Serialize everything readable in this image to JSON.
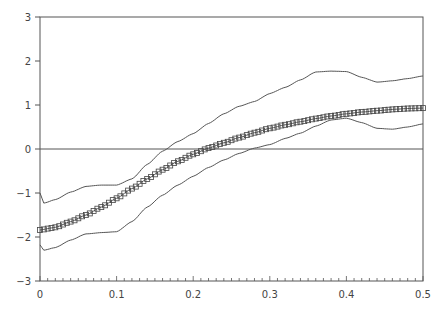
{
  "chart_data": {
    "type": "line",
    "title": "",
    "xlabel": "",
    "ylabel": "",
    "xlim": [
      0,
      0.5
    ],
    "ylim": [
      -3,
      3
    ],
    "grid": false,
    "legend": null,
    "x_ticks": [
      "0",
      "0.1",
      "0.2",
      "0.3",
      "0.4",
      "0.5"
    ],
    "y_ticks": [
      "-3",
      "-2",
      "-1",
      "0",
      "1",
      "2",
      "3"
    ],
    "reference_line": {
      "y": 0
    },
    "series": [
      {
        "name": "estimate",
        "style": "line-with-square-markers",
        "x": [
          0,
          0.02,
          0.04,
          0.06,
          0.08,
          0.1,
          0.12,
          0.14,
          0.16,
          0.18,
          0.2,
          0.22,
          0.24,
          0.26,
          0.28,
          0.3,
          0.32,
          0.34,
          0.36,
          0.38,
          0.4,
          0.42,
          0.44,
          0.46,
          0.48,
          0.5
        ],
        "values": [
          -1.84,
          -1.78,
          -1.65,
          -1.5,
          -1.32,
          -1.12,
          -0.9,
          -0.68,
          -0.47,
          -0.28,
          -0.12,
          0.02,
          0.14,
          0.26,
          0.37,
          0.47,
          0.55,
          0.62,
          0.69,
          0.75,
          0.8,
          0.84,
          0.87,
          0.9,
          0.92,
          0.93
        ]
      },
      {
        "name": "upper band",
        "style": "line",
        "x": [
          0,
          0.005,
          0.02,
          0.04,
          0.06,
          0.08,
          0.1,
          0.12,
          0.14,
          0.16,
          0.18,
          0.2,
          0.22,
          0.24,
          0.26,
          0.28,
          0.3,
          0.32,
          0.34,
          0.36,
          0.38,
          0.4,
          0.42,
          0.44,
          0.46,
          0.48,
          0.5
        ],
        "values": [
          -1.0,
          -1.23,
          -1.15,
          -0.98,
          -0.85,
          -0.82,
          -0.82,
          -0.68,
          -0.35,
          -0.05,
          0.17,
          0.35,
          0.58,
          0.8,
          0.97,
          1.08,
          1.26,
          1.4,
          1.57,
          1.75,
          1.77,
          1.76,
          1.63,
          1.52,
          1.55,
          1.6,
          1.66
        ]
      },
      {
        "name": "lower band",
        "style": "line",
        "x": [
          0,
          0.005,
          0.02,
          0.04,
          0.06,
          0.08,
          0.1,
          0.12,
          0.14,
          0.16,
          0.18,
          0.2,
          0.22,
          0.24,
          0.26,
          0.28,
          0.3,
          0.32,
          0.34,
          0.36,
          0.38,
          0.4,
          0.42,
          0.44,
          0.46,
          0.48,
          0.5
        ],
        "values": [
          -2.18,
          -2.3,
          -2.24,
          -2.07,
          -1.93,
          -1.9,
          -1.88,
          -1.65,
          -1.32,
          -1.05,
          -0.82,
          -0.62,
          -0.42,
          -0.25,
          -0.1,
          0.02,
          0.1,
          0.24,
          0.36,
          0.52,
          0.66,
          0.7,
          0.6,
          0.47,
          0.45,
          0.5,
          0.57
        ]
      }
    ]
  },
  "layout": {
    "plot_left": 40,
    "plot_right": 423,
    "plot_top": 17,
    "plot_bottom": 281,
    "line_color": "#555555",
    "marker_color": "#444444",
    "axis_color": "#555555"
  }
}
